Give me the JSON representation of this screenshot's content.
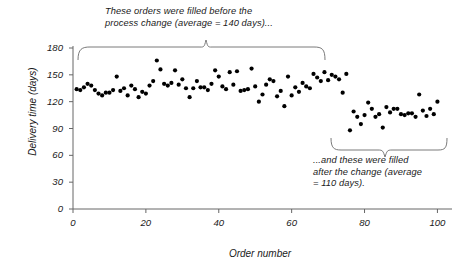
{
  "chart_data": {
    "type": "scatter",
    "title": "",
    "xlabel": "Order number",
    "ylabel": "Delivery time (days)",
    "xlim": [
      0,
      104
    ],
    "ylim": [
      0,
      180
    ],
    "xticks": [
      0,
      20,
      40,
      60,
      80,
      100
    ],
    "yticks": [
      0,
      30,
      60,
      90,
      120,
      150,
      180
    ],
    "grid": false,
    "legend": "none",
    "marker": "filled-circle",
    "marker_color": "#000000",
    "series": [
      {
        "name": "Before process change",
        "average": 140,
        "x": [
          1,
          2,
          3,
          4,
          5,
          6,
          7,
          8,
          9,
          10,
          11,
          12,
          13,
          14,
          15,
          16,
          17,
          18,
          19,
          20,
          21,
          22,
          23,
          24,
          25,
          26,
          27,
          28,
          29,
          30,
          31,
          32,
          33,
          34,
          35,
          36,
          37,
          38,
          39,
          40,
          41,
          42,
          43,
          44,
          45,
          46,
          47,
          48,
          49,
          50,
          51,
          52,
          53,
          54,
          55,
          56,
          57,
          58,
          59,
          60,
          61,
          62,
          63,
          64,
          65,
          66,
          67,
          68,
          69,
          70,
          71,
          72,
          73,
          74,
          75
        ],
        "y": [
          134,
          133,
          136,
          140,
          138,
          133,
          129,
          127,
          130,
          130,
          133,
          148,
          132,
          135,
          127,
          138,
          134,
          125,
          131,
          129,
          138,
          143,
          166,
          156,
          140,
          138,
          141,
          155,
          139,
          145,
          135,
          125,
          135,
          143,
          136,
          136,
          133,
          140,
          155,
          148,
          137,
          134,
          153,
          139,
          154,
          132,
          133,
          134,
          157,
          137,
          120,
          128,
          139,
          145,
          143,
          126,
          132,
          115,
          148,
          127,
          136,
          131,
          141,
          137,
          135,
          151,
          147,
          143,
          153,
          144,
          150,
          148,
          145,
          130,
          151
        ]
      },
      {
        "name": "After process change",
        "average": 110,
        "x": [
          76,
          77,
          78,
          79,
          80,
          81,
          82,
          83,
          84,
          85,
          86,
          87,
          88,
          89,
          90,
          91,
          92,
          93,
          94,
          95,
          96,
          97,
          98,
          99,
          100
        ],
        "y": [
          88,
          109,
          103,
          95,
          105,
          119,
          112,
          103,
          106,
          91,
          114,
          108,
          112,
          112,
          106,
          105,
          107,
          107,
          103,
          128,
          110,
          104,
          112,
          106,
          120
        ]
      }
    ],
    "annotations": [
      {
        "id": "before-note",
        "text": "These orders were filled before the\nprocess change (average = 140 days)...",
        "brace": "top-pointing-down",
        "covers_x": [
          1,
          75
        ]
      },
      {
        "id": "after-note",
        "text": "...and these were filled\nafter the change (average\n= 110 days).",
        "brace": "bottom-pointing-down",
        "covers_x": [
          76,
          100
        ]
      }
    ]
  },
  "axes": {
    "y_label": "Delivery time (days)",
    "x_label": "Order number",
    "y_tick_labels": [
      "180",
      "150",
      "120",
      "90",
      "60",
      "30",
      "0"
    ],
    "x_tick_labels": [
      "0",
      "20",
      "40",
      "60",
      "80",
      "100"
    ]
  },
  "annotations": {
    "before": "These orders were filled before the\nprocess change (average = 140 days)...",
    "after": "...and these were filled\nafter the change (average\n= 110 days)."
  },
  "colors": {
    "marker": "#000000",
    "axis": "#5a5a5a",
    "text": "#1a1a1a",
    "brace": "#4d4d4d",
    "background": "#ffffff"
  }
}
